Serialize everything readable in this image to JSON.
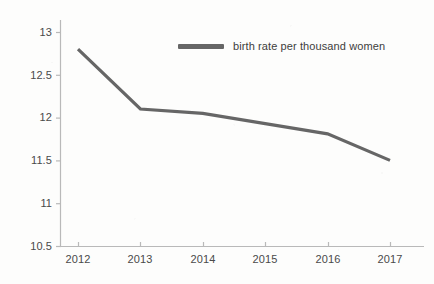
{
  "chart_data": {
    "type": "line",
    "title": "",
    "subtitle": "",
    "xlabel": "",
    "ylabel": "",
    "categories": [
      "2012",
      "2013",
      "2014",
      "2015",
      "2016",
      "2017"
    ],
    "x": [
      2012,
      2013,
      2014,
      2015,
      2016,
      2017
    ],
    "series": [
      {
        "name": "birth rate per thousand women",
        "values": [
          12.8,
          12.1,
          12.05,
          11.93,
          11.81,
          11.5
        ],
        "color": "#666666"
      }
    ],
    "xlim": [
      2012,
      2017
    ],
    "ylim": [
      10.5,
      13
    ],
    "y_ticks": [
      "13",
      "12.5",
      "12",
      "11.5",
      "11",
      "10.5"
    ],
    "y_tick_values": [
      13,
      12.5,
      12,
      11.5,
      11,
      10.5
    ],
    "x_ticks": [
      "2012",
      "2013",
      "2014",
      "2015",
      "2016",
      "2017"
    ],
    "grid": false,
    "legend_position": "top-center",
    "legend": [
      "birth rate per thousand women"
    ],
    "annotations": []
  },
  "legend": {
    "label": "birth rate per thousand women",
    "swatch_color": "#666666"
  },
  "axes": {
    "line_color": "#b9b9b9",
    "tick_color": "#b9b9b9",
    "label_color": "#4a4a4a"
  },
  "canvas": {
    "background": "#fdfdfc",
    "width": 434,
    "height": 284
  }
}
